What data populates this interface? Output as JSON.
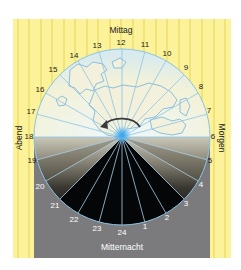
{
  "diagram": {
    "labels": {
      "top": "Mittag",
      "bottom": "Mitternacht",
      "left": "Abend",
      "right": "Morgen"
    },
    "hours": [
      {
        "h": "12",
        "x": 121,
        "y": 45
      },
      {
        "h": "11",
        "x": 145,
        "y": 47
      },
      {
        "h": "10",
        "x": 167,
        "y": 56
      },
      {
        "h": "9",
        "x": 186,
        "y": 70
      },
      {
        "h": "8",
        "x": 201,
        "y": 89
      },
      {
        "h": "7",
        "x": 209,
        "y": 113
      },
      {
        "h": "6",
        "x": 213,
        "y": 139
      },
      {
        "h": "5",
        "x": 210,
        "y": 163
      },
      {
        "h": "4",
        "x": 201,
        "y": 187
      },
      {
        "h": "3",
        "x": 186,
        "y": 206
      },
      {
        "h": "2",
        "x": 167,
        "y": 220
      },
      {
        "h": "1",
        "x": 145,
        "y": 229
      },
      {
        "h": "24",
        "x": 122,
        "y": 235
      },
      {
        "h": "23",
        "x": 97,
        "y": 231
      },
      {
        "h": "22",
        "x": 74,
        "y": 222
      },
      {
        "h": "21",
        "x": 55,
        "y": 208
      },
      {
        "h": "20",
        "x": 40,
        "y": 189
      },
      {
        "h": "19",
        "x": 32,
        "y": 163
      },
      {
        "h": "18",
        "x": 29,
        "y": 139
      },
      {
        "h": "17",
        "x": 31,
        "y": 114
      },
      {
        "h": "16",
        "x": 40,
        "y": 92
      },
      {
        "h": "15",
        "x": 53,
        "y": 72
      },
      {
        "h": "14",
        "x": 74,
        "y": 58
      },
      {
        "h": "13",
        "x": 97,
        "y": 48
      }
    ],
    "colors": {
      "yellow_bg": "#fbf29a",
      "yellow_stripe": "#e9d85a",
      "sky": "#f4f3d6",
      "sea_blue": "#bfe0f3",
      "night": "#050608",
      "gray_panel": "#7b7b7d",
      "line_blue": "#8cc4e6",
      "arrow": "#3a3a3a",
      "sun_glow": "#3aa7ec"
    }
  }
}
